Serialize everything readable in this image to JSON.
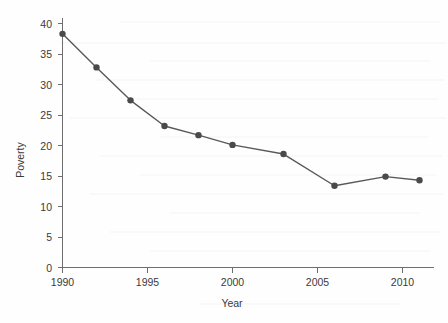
{
  "chart_data": {
    "type": "line",
    "title": "",
    "subtitle": "",
    "xlabel": "Year",
    "ylabel": "Poverty",
    "x": [
      1990,
      1992,
      1994,
      1996,
      1998,
      2000,
      2003,
      2006,
      2009,
      2011
    ],
    "values": [
      38.3,
      32.8,
      27.4,
      23.2,
      21.7,
      20.1,
      18.6,
      13.4,
      14.9,
      14.3
    ],
    "series": [
      {
        "name": "Poverty",
        "values": [
          38.3,
          32.8,
          27.4,
          23.2,
          21.7,
          20.1,
          18.6,
          13.4,
          14.9,
          14.3
        ]
      }
    ],
    "xlim": [
      1989.2,
      2012.2
    ],
    "ylim": [
      0,
      41.5
    ],
    "xticks": [
      1990,
      1995,
      2000,
      2005,
      2010
    ],
    "xtick_labels": [
      "1990",
      "1995",
      "2000",
      "2005",
      "2010"
    ],
    "yticks": [
      0,
      5,
      10,
      15,
      20,
      25,
      30,
      35,
      40
    ],
    "ytick_labels": [
      "0",
      "5",
      "10",
      "15",
      "20",
      "25",
      "30",
      "35",
      "40"
    ],
    "grid": false,
    "legend": "none",
    "marker": "circle",
    "line_color": "#595959",
    "marker_color": "#4a4a4a",
    "axis_color": "#6e6e6e",
    "background_color": "#fefefe"
  }
}
